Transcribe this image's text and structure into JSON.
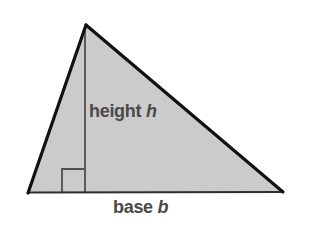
{
  "diagram": {
    "labels": {
      "height": {
        "text": "height",
        "symbol": "h"
      },
      "base": {
        "text": "base",
        "symbol": "b"
      }
    },
    "colors": {
      "background": "#ffffff",
      "triangle_fill": "#cbcbcb",
      "triangle_outline": "#111111",
      "base_edge": "#2e2e2e",
      "inner_lines": "#4f4f4f",
      "label_text": "#4a4a4a"
    }
  }
}
